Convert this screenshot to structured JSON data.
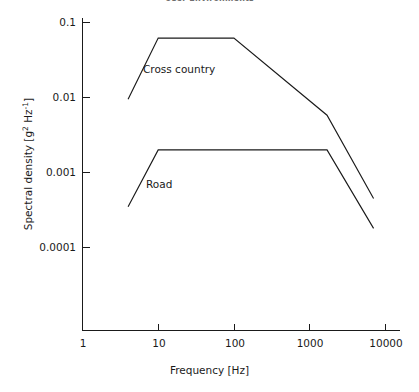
{
  "chart_data": {
    "type": "line",
    "title": "User Environments",
    "xlabel": "Frequency [Hz]",
    "ylabel": "Spectral density [g² Hz⁻¹]",
    "ylabel_base": "Spectral density [g",
    "ylabel_sup1": "2",
    "ylabel_mid": " Hz",
    "ylabel_sup2": "-1",
    "ylabel_end": "]",
    "xscale": "log",
    "yscale": "log",
    "xlim": [
      1,
      10000
    ],
    "ylim": [
      1e-05,
      0.1
    ],
    "grid": false,
    "legend": "inline-annotations",
    "xticks": [
      1,
      10,
      100,
      1000,
      10000
    ],
    "xtick_labels": [
      "1",
      "10",
      "100",
      "1000",
      "10000"
    ],
    "yticks": [
      0.1,
      0.01,
      0.001,
      0.0001
    ],
    "ytick_labels": [
      "0.1",
      "0.01",
      "0.001",
      "0.0001"
    ],
    "series": [
      {
        "name": "Cross country",
        "label": "Cross country",
        "x": [
          4,
          10,
          100,
          1700,
          7000
        ],
        "y": [
          0.0095,
          0.062,
          0.062,
          0.0058,
          0.00045
        ]
      },
      {
        "name": "Road",
        "label": "Road",
        "x": [
          4,
          10,
          1700,
          7000
        ],
        "y": [
          0.00035,
          0.002,
          0.002,
          0.00018
        ]
      }
    ],
    "annotations": [
      {
        "text": "Cross country",
        "x_px": 143,
        "y_px": 63
      },
      {
        "text": "Road",
        "x_px": 146,
        "y_px": 178
      }
    ]
  },
  "colors": {
    "line": "#1a1a1a",
    "background": "#ffffff",
    "title": "#6f6f6f"
  }
}
